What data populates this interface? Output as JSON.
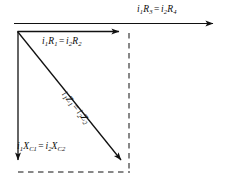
{
  "figure": {
    "background_color": "#ffffff",
    "stroke_color": "#111111",
    "width": 234,
    "height": 186
  },
  "labels": {
    "top_outer": {
      "text": "i1R3 = i2R4",
      "left": {
        "var": "i",
        "sub": "1",
        "var2": "R",
        "sub2": "3"
      },
      "right": {
        "var": "i",
        "sub": "2",
        "var2": "R",
        "sub2": "4"
      },
      "operator": "="
    },
    "inner_horizontal": {
      "text": "i1R1 = i2R2",
      "left": {
        "var": "i",
        "sub": "1",
        "var2": "R",
        "sub2": "1"
      },
      "right": {
        "var": "i",
        "sub": "2",
        "var2": "R",
        "sub2": "2"
      },
      "operator": "="
    },
    "diagonal": {
      "text": "i1Z1 = i2Z2",
      "left": {
        "var": "i",
        "sub": "1",
        "var2": "Z",
        "sub2": "1"
      },
      "right": {
        "var": "i",
        "sub": "2",
        "var2": "Z",
        "sub2": "2"
      },
      "operator": "="
    },
    "vertical_reactance": {
      "text": "i1XC1 = i2XC2",
      "left": {
        "var": "i",
        "sub": "1",
        "var2": "X",
        "sub2": "C1"
      },
      "right": {
        "var": "i",
        "sub": "2",
        "var2": "X",
        "sub2": "C2"
      },
      "operator": "="
    }
  },
  "vectors": {
    "top_reference_arrow": {
      "name": "i1R3 = i2R4 reference phasor",
      "x1": 14,
      "y1": 23.5,
      "x2": 221,
      "y2": 23.5,
      "style": "solid",
      "arrowhead": "end"
    },
    "resistive_arrow": {
      "name": "i1R1 = i2R2 resistive drop",
      "x1": 17.5,
      "y1": 31.5,
      "x2": 126,
      "y2": 31.5,
      "style": "solid",
      "arrowhead": "end"
    },
    "impedance_arrow": {
      "name": "i1Z1 = i2Z2 total impedance drop",
      "x1": 17.5,
      "y1": 31.5,
      "x2": 127,
      "y2": 167,
      "style": "solid",
      "arrowhead": "end"
    },
    "capacitive_arrow": {
      "name": "i1XC1 = i2XC2 capacitive drop",
      "x1": 18,
      "y1": 31.5,
      "x2": 18,
      "y2": 167,
      "style": "solid",
      "arrowhead": "end"
    },
    "dashed_vertical": {
      "name": "construction line right side",
      "x1": 129,
      "y1": 33,
      "x2": 129,
      "y2": 172,
      "style": "dashed",
      "arrowhead": "none"
    },
    "dashed_horizontal": {
      "name": "construction line bottom",
      "x1": 18,
      "y1": 172,
      "x2": 130,
      "y2": 172,
      "style": "dashed",
      "arrowhead": "none"
    }
  }
}
